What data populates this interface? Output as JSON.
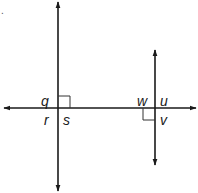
{
  "diagram": {
    "type": "geometry-perpendicular-lines",
    "corner_mark": ".",
    "colors": {
      "line": "#1a1a1a",
      "right_angle": "#333333",
      "label": "#1a1a1a",
      "background": "#ffffff"
    },
    "lines": [
      {
        "id": "vertical-left",
        "x1": 58,
        "y1": 2,
        "x2": 58,
        "y2": 191,
        "arrows": "both"
      },
      {
        "id": "vertical-right",
        "x1": 155,
        "y1": 50,
        "x2": 155,
        "y2": 165,
        "arrows": "both"
      },
      {
        "id": "horizontal",
        "x1": 4,
        "y1": 108,
        "x2": 196,
        "y2": 108,
        "arrows": "both"
      }
    ],
    "right_angle_marks": [
      {
        "id": "left-intersection",
        "x": 58,
        "y": 96,
        "w": 12,
        "h": 12,
        "quadrant": "upper-right"
      },
      {
        "id": "right-intersection",
        "x": 143,
        "y": 108,
        "w": 12,
        "h": 12,
        "quadrant": "lower-left"
      }
    ],
    "labels": [
      {
        "id": "q",
        "text": "q",
        "x": 41,
        "y": 94
      },
      {
        "id": "r",
        "text": "r",
        "x": 44,
        "y": 113
      },
      {
        "id": "s",
        "text": "s",
        "x": 63,
        "y": 113
      },
      {
        "id": "w",
        "text": "w",
        "x": 137,
        "y": 94
      },
      {
        "id": "u",
        "text": "u",
        "x": 160,
        "y": 94
      },
      {
        "id": "v",
        "text": "v",
        "x": 160,
        "y": 113
      }
    ]
  }
}
